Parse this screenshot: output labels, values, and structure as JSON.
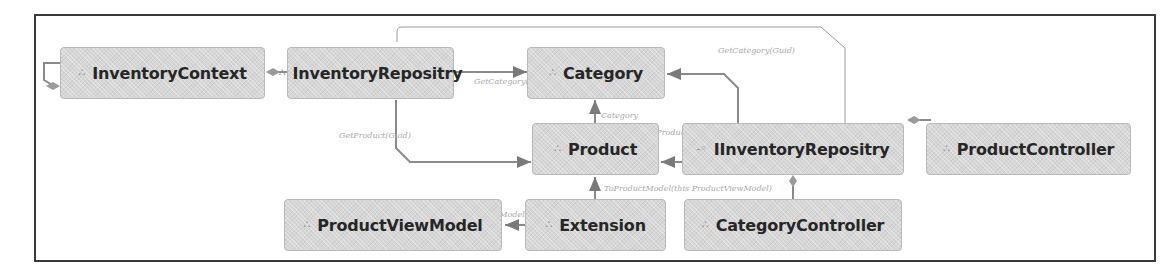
{
  "diagram": {
    "type": "class-dependency-diagram",
    "nodes": [
      {
        "id": "inventory-context",
        "label": "InventoryContext",
        "icon": "class-icon",
        "glyph": "∴"
      },
      {
        "id": "inventory-repositry",
        "label": "InventoryRepositry",
        "icon": "class-icon",
        "glyph": "∴"
      },
      {
        "id": "category",
        "label": "Category",
        "icon": "class-icon",
        "glyph": "∴"
      },
      {
        "id": "product",
        "label": "Product",
        "icon": "class-icon",
        "glyph": "∴"
      },
      {
        "id": "iinventory-repositry",
        "label": "IInventoryRepositry",
        "icon": "interface-icon",
        "glyph": "-◦"
      },
      {
        "id": "product-controller",
        "label": "ProductController",
        "icon": "class-icon",
        "glyph": "∴"
      },
      {
        "id": "product-view-model",
        "label": "ProductViewModel",
        "icon": "class-icon",
        "glyph": "∴"
      },
      {
        "id": "extension",
        "label": "Extension",
        "icon": "class-icon",
        "glyph": "∴"
      },
      {
        "id": "category-controller",
        "label": "CategoryController",
        "icon": "class-icon",
        "glyph": "∴"
      }
    ],
    "edges": [
      {
        "from": "inventory-context",
        "to": "inventory-context",
        "kind": "aggregation-self",
        "label": ""
      },
      {
        "from": "inventory-repositry",
        "to": "inventory-context",
        "kind": "aggregation",
        "label": ""
      },
      {
        "from": "inventory-repositry",
        "to": "category",
        "kind": "dependency",
        "label": "GetCategory(Guid)"
      },
      {
        "from": "inventory-repositry",
        "to": "product",
        "kind": "dependency",
        "label": "GetProduct(Guid)"
      },
      {
        "from": "inventory-repositry",
        "to": "iinventory-repositry",
        "kind": "implements",
        "label": "GetCategory(Guid)"
      },
      {
        "from": "product",
        "to": "category",
        "kind": "association",
        "label": "Category"
      },
      {
        "from": "iinventory-repositry",
        "to": "product",
        "kind": "dependency",
        "label": "GetProduct(Guid)"
      },
      {
        "from": "iinventory-repositry",
        "to": "category",
        "kind": "dependency",
        "label": ""
      },
      {
        "from": "product-controller",
        "to": "iinventory-repositry",
        "kind": "aggregation",
        "label": ""
      },
      {
        "from": "category-controller",
        "to": "iinventory-repositry",
        "kind": "aggregation",
        "label": ""
      },
      {
        "from": "extension",
        "to": "product",
        "kind": "dependency",
        "label": "ToProductModel(this ProductViewModel)"
      },
      {
        "from": "extension",
        "to": "product-view-model",
        "kind": "dependency",
        "label": "ToViewModel(this Product)"
      }
    ]
  }
}
